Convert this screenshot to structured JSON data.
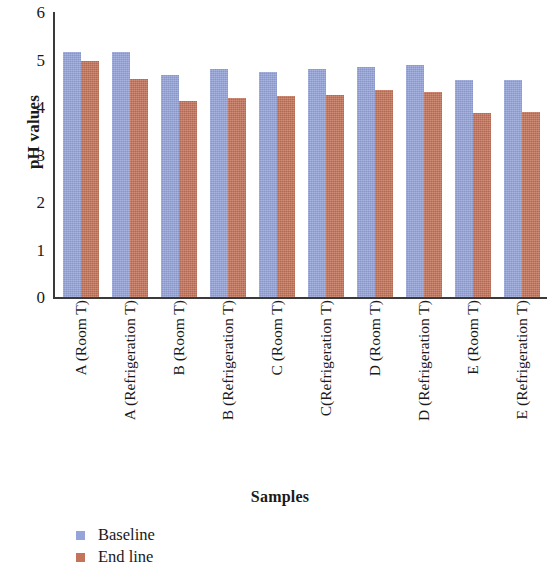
{
  "chart_data": {
    "type": "bar",
    "title": "",
    "xlabel": "Samples",
    "ylabel": "pH values",
    "ylim": [
      0,
      6
    ],
    "yticks": [
      0,
      1,
      2,
      3,
      4,
      5,
      6
    ],
    "grid": false,
    "legend_position": "bottom-left",
    "categories": [
      "A (Room T)",
      "A (Refrigeration T)",
      "B (Room T)",
      "B (Refrigeration T)",
      "C (Room T)",
      "C(Refrigeration T)",
      "D (Room T)",
      "D (Refrigeration T)",
      "E (Room T)",
      "E (Refrigeration T)"
    ],
    "series": [
      {
        "name": "Baseline",
        "color": "#96a4da",
        "values": [
          5.15,
          5.15,
          4.68,
          4.79,
          4.73,
          4.81,
          4.84,
          4.88,
          4.57,
          4.57
        ]
      },
      {
        "name": "End line",
        "color": "#c4745b",
        "values": [
          4.97,
          4.6,
          4.12,
          4.2,
          4.24,
          4.26,
          4.36,
          4.32,
          3.87,
          3.9
        ]
      }
    ]
  },
  "legend": {
    "items": [
      {
        "label": "Baseline",
        "color": "#96a4da"
      },
      {
        "label": "End line",
        "color": "#c4745b"
      }
    ]
  }
}
